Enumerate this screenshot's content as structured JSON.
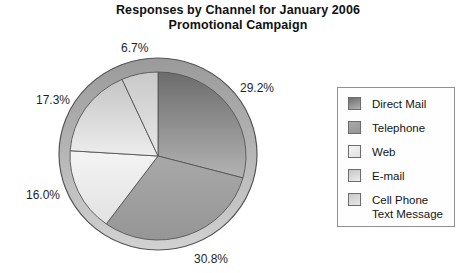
{
  "chart_data": {
    "type": "pie",
    "title": "Responses by Channel for January 2006 Promotional Campaign",
    "title_lines": [
      "Responses by Channel for January 2006",
      "Promotional Campaign"
    ],
    "start_angle_deg": 0,
    "direction": "clockwise",
    "total_pct": 100.0,
    "slices": [
      {
        "name": "Direct Mail",
        "value_pct": 29.2,
        "label": "29.2%",
        "color_top": "#6c6c6c",
        "color_bottom": "#b3b3b3"
      },
      {
        "name": "Telephone",
        "value_pct": 30.8,
        "label": "30.8%",
        "color_top": "#a8a8a8",
        "color_bottom": "#969696"
      },
      {
        "name": "Web",
        "value_pct": 16.0,
        "label": "16.0%",
        "color_top": "#f4f4f4",
        "color_bottom": "#e2e2e2"
      },
      {
        "name": "E-mail",
        "value_pct": 17.3,
        "label": "17.3%",
        "color_top": "#c5c5c5",
        "color_bottom": "#ededed"
      },
      {
        "name": "Cell Phone Text Message",
        "value_pct": 6.7,
        "label": "6.7%",
        "color_top": "#c9c9c9",
        "color_bottom": "#e8e8e8"
      }
    ],
    "legend": {
      "position": "right"
    }
  },
  "colors": {
    "ring_top": "#9a9a9a",
    "ring_bottom": "#d2d2d2",
    "outline": "#565656",
    "background": "#ffffff"
  }
}
